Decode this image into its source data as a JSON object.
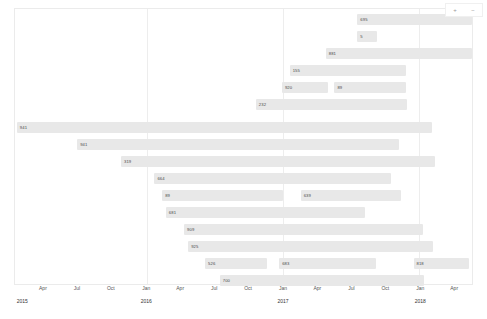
{
  "chart_data": {
    "type": "bar",
    "orientation": "horizontal-timeline",
    "title": "",
    "xlabel": "",
    "ylabel": "",
    "grid": true,
    "legend": null,
    "xlim": [
      "2015-01",
      "2018-05"
    ],
    "x_ticks": [
      {
        "label": "Apr",
        "pos": 6.3
      },
      {
        "label": "Jul",
        "pos": 13.7
      },
      {
        "label": "Oct",
        "pos": 21.1
      },
      {
        "label": "Jan",
        "pos": 28.8
      },
      {
        "label": "Apr",
        "pos": 36.2
      },
      {
        "label": "Jul",
        "pos": 43.6
      },
      {
        "label": "Oct",
        "pos": 51.0
      },
      {
        "label": "Jan",
        "pos": 58.6
      },
      {
        "label": "Apr",
        "pos": 66.1
      },
      {
        "label": "Jul",
        "pos": 73.5
      },
      {
        "label": "Oct",
        "pos": 80.9
      },
      {
        "label": "Jan",
        "pos": 88.5
      },
      {
        "label": "Apr",
        "pos": 95.9
      }
    ],
    "year_ticks": [
      {
        "label": "2015",
        "pos": 0.6
      },
      {
        "label": "2016",
        "pos": 28.8
      },
      {
        "label": "2017",
        "pos": 58.6
      },
      {
        "label": "2018",
        "pos": 88.5
      }
    ],
    "gridlines": [
      28.8,
      58.6,
      88.5
    ],
    "bar_color": "#e8e8e8",
    "rows": [
      {
        "index": 0,
        "top": 5,
        "segments": [
          {
            "value": "695",
            "start": 74.9,
            "width": 25.1
          }
        ]
      },
      {
        "index": 1,
        "top": 22,
        "segments": [
          {
            "value": "5",
            "start": 74.9,
            "width": 4.4
          }
        ]
      },
      {
        "index": 2,
        "top": 39,
        "segments": [
          {
            "value": "881",
            "start": 68.0,
            "width": 32.0
          }
        ]
      },
      {
        "index": 3,
        "top": 56,
        "segments": [
          {
            "value": "155",
            "start": 60.1,
            "width": 25.5
          }
        ]
      },
      {
        "index": 4,
        "top": 73,
        "segments": [
          {
            "value": "920",
            "start": 58.4,
            "width": 10.0
          },
          {
            "value": "89",
            "start": 69.9,
            "width": 15.6
          }
        ]
      },
      {
        "index": 5,
        "top": 90,
        "segments": [
          {
            "value": "232",
            "start": 52.7,
            "width": 33.1
          }
        ]
      },
      {
        "index": 6,
        "top": 113,
        "segments": [
          {
            "value": "941",
            "start": 0.4,
            "width": 90.8
          }
        ]
      },
      {
        "index": 7,
        "top": 130,
        "segments": [
          {
            "value": "941",
            "start": 13.6,
            "width": 70.5
          }
        ]
      },
      {
        "index": 8,
        "top": 147,
        "segments": [
          {
            "value": "319",
            "start": 23.2,
            "width": 68.7
          }
        ]
      },
      {
        "index": 9,
        "top": 164,
        "segments": [
          {
            "value": "664",
            "start": 30.5,
            "width": 51.7
          }
        ]
      },
      {
        "index": 10,
        "top": 181,
        "segments": [
          {
            "value": "89",
            "start": 32.2,
            "width": 26.5
          },
          {
            "value": "639",
            "start": 62.5,
            "width": 22.0
          }
        ]
      },
      {
        "index": 11,
        "top": 198,
        "segments": [
          {
            "value": "681",
            "start": 33.0,
            "width": 43.5
          }
        ]
      },
      {
        "index": 12,
        "top": 215,
        "segments": [
          {
            "value": "909",
            "start": 37.0,
            "width": 52.3
          }
        ]
      },
      {
        "index": 13,
        "top": 232,
        "segments": [
          {
            "value": "925",
            "start": 37.9,
            "width": 53.5
          }
        ]
      },
      {
        "index": 14,
        "top": 249,
        "segments": [
          {
            "value": "526",
            "start": 41.6,
            "width": 13.5
          },
          {
            "value": "683",
            "start": 57.8,
            "width": 21.2
          },
          {
            "value": "818",
            "start": 87.2,
            "width": 12.2
          }
        ]
      },
      {
        "index": 15,
        "top": 266,
        "segments": [
          {
            "value": "700",
            "start": 44.8,
            "width": 44.8
          }
        ]
      }
    ]
  },
  "controls": {
    "zoom_in_label": "+",
    "zoom_out_label": "−"
  }
}
